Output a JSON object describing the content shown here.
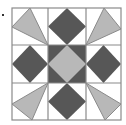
{
  "figure": {
    "type": "quilt-block",
    "grid": {
      "rows": 3,
      "cols": 3
    },
    "colors": {
      "background": "#ffffff",
      "grid_line": "#8a8a8a",
      "dark": "#575757",
      "light": "#b8b8b8"
    },
    "cells": [
      {
        "row": 0,
        "col": 0,
        "shape": "triangle",
        "fill": "light",
        "orientation": "top-left"
      },
      {
        "row": 0,
        "col": 1,
        "shape": "diamond",
        "fill": "dark"
      },
      {
        "row": 0,
        "col": 2,
        "shape": "triangle",
        "fill": "light",
        "orientation": "top-right"
      },
      {
        "row": 1,
        "col": 0,
        "shape": "diamond",
        "fill": "dark"
      },
      {
        "row": 1,
        "col": 1,
        "shape": "square-with-diamond",
        "fill": "dark",
        "inner_fill": "light"
      },
      {
        "row": 1,
        "col": 2,
        "shape": "diamond",
        "fill": "dark"
      },
      {
        "row": 2,
        "col": 0,
        "shape": "triangle",
        "fill": "light",
        "orientation": "bottom-left"
      },
      {
        "row": 2,
        "col": 1,
        "shape": "diamond",
        "fill": "dark"
      },
      {
        "row": 2,
        "col": 2,
        "shape": "triangle",
        "fill": "light",
        "orientation": "bottom-right"
      }
    ]
  }
}
